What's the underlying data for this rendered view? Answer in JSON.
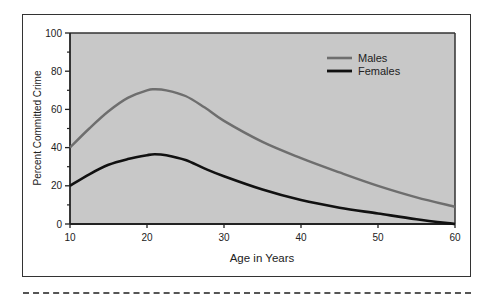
{
  "chart_data": {
    "type": "line",
    "title": "",
    "xlabel": "Age in Years",
    "ylabel": "Percent Committed Crime",
    "xlim": [
      10,
      60
    ],
    "ylim": [
      0,
      100
    ],
    "x_ticks": [
      10,
      20,
      30,
      40,
      50,
      60
    ],
    "y_ticks": [
      0,
      20,
      40,
      60,
      80,
      100
    ],
    "y_minor_ticks": [
      10,
      30,
      50,
      70,
      90
    ],
    "grid": false,
    "legend_position": "upper right",
    "background": "#c8c8c8",
    "x": [
      10,
      12.5,
      15,
      17.5,
      20,
      21,
      22.5,
      25,
      27.5,
      30,
      35,
      40,
      45,
      50,
      55,
      60
    ],
    "series": [
      {
        "name": "Males",
        "color": "#6e6e6e",
        "values": [
          40,
          50,
          59,
          66,
          70,
          70.5,
          70,
          67,
          61,
          54,
          43,
          34.5,
          27,
          20,
          14,
          9
        ]
      },
      {
        "name": "Females",
        "color": "#111111",
        "values": [
          20,
          26,
          31,
          34,
          36,
          36.5,
          36,
          33.5,
          29,
          25,
          18,
          12.5,
          8.5,
          5.5,
          2.5,
          0
        ]
      }
    ]
  },
  "legend": {
    "males": "Males",
    "females": "Females"
  }
}
